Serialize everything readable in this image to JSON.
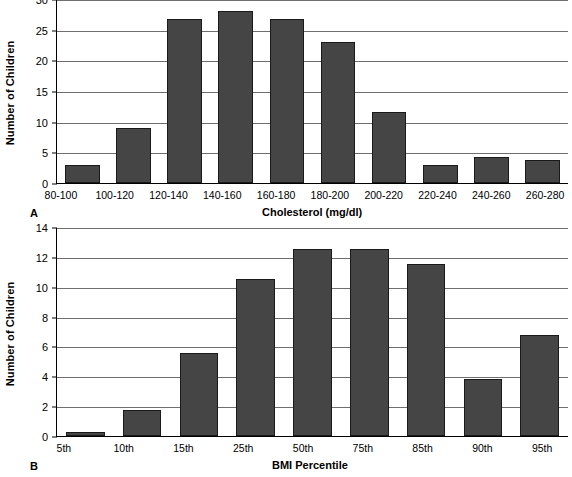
{
  "figure": {
    "background": "#ffffff",
    "bar_fill": "#454545",
    "bar_border": "#1a1a1a",
    "grid_color": "#6e6e6e",
    "axis_color": "#000000"
  },
  "panels": [
    {
      "letter": "A",
      "ylabel": "Number of Children",
      "xlabel": "Cholesterol (mg/dl)",
      "yticks": [
        "0",
        "5",
        "10",
        "15",
        "20",
        "25",
        "30"
      ],
      "xticks": [
        "80-100",
        "100-120",
        "120-140",
        "140-160",
        "160-180",
        "180-200",
        "200-220",
        "220-240",
        "240-260",
        "260-280"
      ]
    },
    {
      "letter": "B",
      "ylabel": "Number of Children",
      "xlabel": "BMI Percentile",
      "yticks": [
        "0",
        "2",
        "4",
        "6",
        "8",
        "10",
        "12",
        "14"
      ],
      "xticks": [
        "5th",
        "10th",
        "15th",
        "25th",
        "50th",
        "75th",
        "85th",
        "90th",
        "95th"
      ]
    }
  ],
  "chart_data": [
    {
      "type": "bar",
      "panel": "A",
      "title": "",
      "xlabel": "Cholesterol (mg/dl)",
      "ylabel": "Number of Children",
      "categories": [
        "80-100",
        "100-120",
        "120-140",
        "140-160",
        "160-180",
        "180-200",
        "200-220",
        "220-240",
        "240-260",
        "260-280"
      ],
      "values": [
        3,
        9,
        26.8,
        28,
        26.8,
        23,
        11.5,
        3,
        4.2,
        3.7
      ],
      "ylim": [
        0,
        30
      ],
      "ytick_values": [
        0,
        5,
        10,
        15,
        20,
        25,
        30
      ],
      "grid": true,
      "legend": "none"
    },
    {
      "type": "bar",
      "panel": "B",
      "title": "",
      "xlabel": "BMI Percentile",
      "ylabel": "Number of Children",
      "categories": [
        "5th",
        "10th",
        "15th",
        "25th",
        "50th",
        "75th",
        "85th",
        "90th",
        "95th"
      ],
      "values": [
        0.25,
        1.75,
        5.55,
        10.5,
        12.55,
        12.55,
        11.5,
        3.8,
        6.8
      ],
      "ylim": [
        0,
        14
      ],
      "ytick_values": [
        0,
        2,
        4,
        6,
        8,
        10,
        12,
        14
      ],
      "grid": true,
      "legend": "none"
    }
  ]
}
